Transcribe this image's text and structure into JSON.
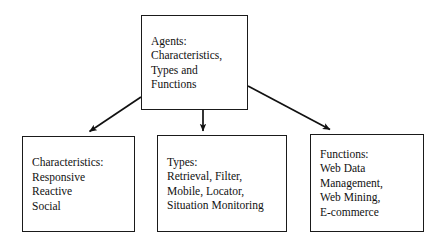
{
  "diagram": {
    "type": "hierarchy-tree",
    "title": "Agents: Characteristics, Types and Functions",
    "background_color": "#ffffff",
    "stroke_color": "#1a1a1a",
    "text_color": "#111111",
    "nodes": [
      {
        "id": "root",
        "role": "root",
        "lines": [
          "Agents:",
          "Characteristics,",
          "Types and",
          "Functions"
        ]
      },
      {
        "id": "characteristics",
        "role": "child",
        "lines": [
          "Characteristics:",
          "Responsive",
          "Reactive",
          "Social"
        ]
      },
      {
        "id": "types",
        "role": "child",
        "lines": [
          "Types:",
          "Retrieval, Filter,",
          "Mobile, Locator,",
          "Situation Monitoring"
        ]
      },
      {
        "id": "functions",
        "role": "child",
        "lines": [
          "Functions:",
          "Web Data",
          "Management,",
          "Web Mining,",
          "E-commerce"
        ]
      }
    ],
    "edges": [
      {
        "id": "root-to-characteristics",
        "from": "root",
        "to": "characteristics",
        "style": "arrow-diagonal-left"
      },
      {
        "id": "root-to-types",
        "from": "root",
        "to": "types",
        "style": "arrow-vertical"
      },
      {
        "id": "root-to-functions",
        "from": "root",
        "to": "functions",
        "style": "arrow-diagonal-right"
      }
    ]
  }
}
